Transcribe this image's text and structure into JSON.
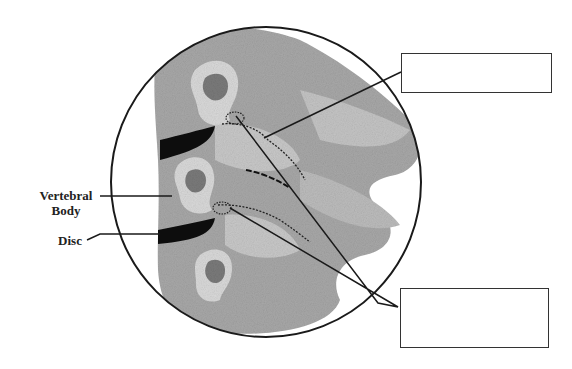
{
  "labels": {
    "vertebral_body_line1": "Vertebral",
    "vertebral_body_line2": "Body",
    "disc": "Disc"
  },
  "answer_boxes": [
    {
      "id": "top",
      "value": ""
    },
    {
      "id": "bottom",
      "value": ""
    }
  ],
  "colors": {
    "line": "#1a1a1a",
    "bone": "#9a9a9a",
    "bone_light": "#d8d8d8",
    "disc": "#0d0d0d"
  }
}
